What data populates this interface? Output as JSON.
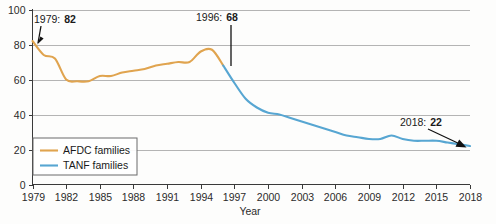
{
  "chart_data": {
    "type": "line",
    "title": "",
    "subtitle": "",
    "xlabel": "Year",
    "ylabel": "",
    "xlim": [
      1979,
      2018
    ],
    "ylim": [
      0,
      100
    ],
    "grid": true,
    "legend_position": "bottom-left",
    "xticks": [
      "1979",
      "1982",
      "1985",
      "1988",
      "1991",
      "1994",
      "1997",
      "2000",
      "2003",
      "2006",
      "2009",
      "2012",
      "2015",
      "2018"
    ],
    "xtick_values": [
      1979,
      1982,
      1985,
      1988,
      1991,
      1994,
      1997,
      2000,
      2003,
      2006,
      2009,
      2012,
      2015,
      2018
    ],
    "yticks": [
      "0",
      "20",
      "40",
      "60",
      "80",
      "100"
    ],
    "ytick_values": [
      0,
      20,
      40,
      60,
      80,
      100
    ],
    "series": [
      {
        "name": "AFDC families",
        "color": "#E0A44F",
        "x": [
          1979,
          1980,
          1981,
          1982,
          1983,
          1984,
          1985,
          1986,
          1987,
          1988,
          1989,
          1990,
          1991,
          1992,
          1993,
          1994,
          1995,
          1996
        ],
        "values": [
          82,
          74,
          72,
          60,
          59,
          59,
          62,
          62,
          64,
          65,
          66,
          68,
          69,
          70,
          70,
          76,
          77,
          68
        ]
      },
      {
        "name": "TANF families",
        "color": "#57A6D2",
        "x": [
          1996,
          1997,
          1998,
          1999,
          2000,
          2001,
          2002,
          2003,
          2004,
          2005,
          2006,
          2007,
          2008,
          2009,
          2010,
          2011,
          2012,
          2013,
          2014,
          2015,
          2016,
          2017,
          2018
        ],
        "values": [
          68,
          58,
          49,
          44,
          41,
          40,
          38,
          36,
          34,
          32,
          30,
          28,
          27,
          26,
          26,
          28,
          26,
          25,
          25,
          25,
          24,
          23,
          22
        ]
      }
    ],
    "annotations": [
      {
        "label_year": "1979:",
        "label_value": "82",
        "x": 1979,
        "y": 82
      },
      {
        "label_year": "1996:",
        "label_value": "68",
        "x": 1996,
        "y": 68
      },
      {
        "label_year": "2018:",
        "label_value": "22",
        "x": 2018,
        "y": 22
      }
    ],
    "legend": [
      {
        "label": "AFDC families",
        "color": "#E0A44F"
      },
      {
        "label": "TANF families",
        "color": "#57A6D2"
      }
    ]
  }
}
